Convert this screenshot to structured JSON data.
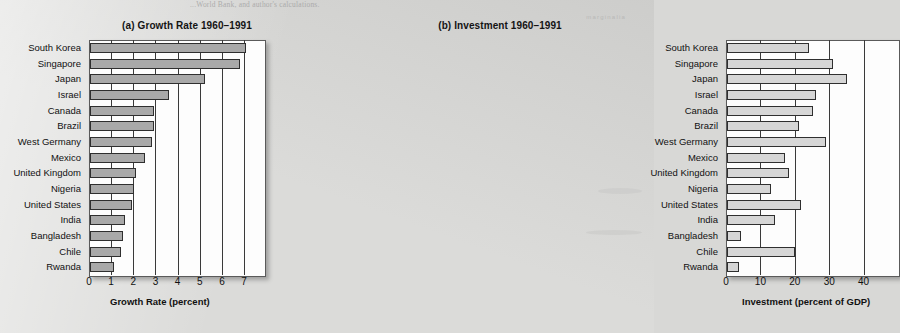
{
  "page": {
    "top_cut_text": "...World Bank, and author's calculations.",
    "edge_mark": "marginalia"
  },
  "chart_data": [
    {
      "type": "bar",
      "orientation": "horizontal",
      "title": "(a) Growth Rate 1960–1991",
      "xlabel": "Growth Rate (percent)",
      "ylabel": "",
      "xlim": [
        0,
        7.9
      ],
      "xticks": [
        0,
        1,
        2,
        3,
        4,
        5,
        6,
        7
      ],
      "xticklabels": [
        "0",
        "1",
        "2",
        "3",
        "4",
        "5",
        "6",
        "7"
      ],
      "grid": true,
      "legend": "none",
      "bar_color": "#a9a9a9",
      "categories": [
        "South Korea",
        "Singapore",
        "Japan",
        "Israel",
        "Canada",
        "Brazil",
        "West Germany",
        "Mexico",
        "United Kingdom",
        "Nigeria",
        "United States",
        "India",
        "Bangladesh",
        "Chile",
        "Rwanda"
      ],
      "values": [
        7.1,
        6.8,
        5.2,
        3.6,
        2.9,
        2.9,
        2.8,
        2.5,
        2.1,
        2.0,
        1.9,
        1.6,
        1.5,
        1.4,
        1.1
      ]
    },
    {
      "type": "bar",
      "orientation": "horizontal",
      "title": "(b) Investment 1960–1991",
      "xlabel": "Investment (percent of GDP)",
      "ylabel": "",
      "xlim": [
        0,
        50
      ],
      "xticks": [
        0,
        10,
        20,
        30,
        40
      ],
      "xticklabels": [
        "0",
        "10",
        "20",
        "30",
        "40"
      ],
      "grid": true,
      "legend": "none",
      "bar_color": "#d6d6d6",
      "categories": [
        "South Korea",
        "Singapore",
        "Japan",
        "Israel",
        "Canada",
        "Brazil",
        "West Germany",
        "Mexico",
        "United Kingdom",
        "Nigeria",
        "United States",
        "India",
        "Bangladesh",
        "Chile",
        "Rwanda"
      ],
      "values": [
        24,
        31,
        35,
        26,
        25,
        21,
        29,
        17,
        18,
        13,
        21.5,
        14,
        4,
        20,
        3.5
      ]
    }
  ]
}
